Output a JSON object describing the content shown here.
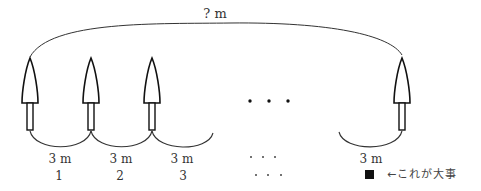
{
  "diagram": {
    "total_label": "? m",
    "trees": [
      {
        "x": 30,
        "name": "tree-1"
      },
      {
        "x": 91,
        "name": "tree-2"
      },
      {
        "x": 152,
        "name": "tree-3"
      },
      {
        "x": 402,
        "name": "tree-last"
      }
    ],
    "gaps": [
      {
        "distance": "3 m",
        "index": "1",
        "x": 60
      },
      {
        "distance": "3 m",
        "index": "2",
        "x": 121
      },
      {
        "distance": "3 m",
        "index": "3",
        "x": 182
      },
      {
        "distance": "3 m",
        "index": "",
        "x": 371
      }
    ],
    "ellipsis_mid": "・・・",
    "ellipsis_distance": "・・・",
    "ellipsis_index": "・・・",
    "note": {
      "marker": "square-black",
      "text": "←これが大事"
    }
  }
}
